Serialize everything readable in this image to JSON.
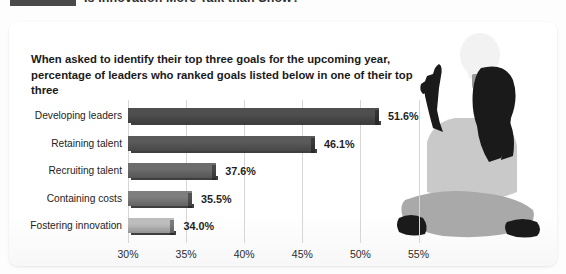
{
  "header": {
    "title": "Is Innovation More Talk than Show?",
    "rule_color": "#4a4a4a"
  },
  "card": {
    "subtitle": "When asked to identify their top three goals for the upcoming year, percentage of leaders who ranked goals listed below in one of their top three"
  },
  "illustration": {
    "person_name": "seated-person-silhouette",
    "bulb_name": "lightbulb-icon",
    "colors": {
      "dark": "#1a1a1a",
      "shirt": "#c9c9c9",
      "legs": "#a9a9a9",
      "bulb": "#f2f2f2",
      "bulb_base": "#9a9a9a"
    }
  },
  "chart_data": {
    "type": "bar",
    "orientation": "horizontal",
    "title": "Is Innovation More Talk than Show?",
    "subtitle": "When asked to identify their top three goals for the upcoming year, percentage of leaders who ranked goals listed below in one of their top three",
    "categories": [
      "Developing leaders",
      "Retaining talent",
      "Recruiting talent",
      "Containing costs",
      "Fostering innovation"
    ],
    "values": [
      51.6,
      46.1,
      37.6,
      35.5,
      34.0
    ],
    "value_labels": [
      "51.6%",
      "46.1%",
      "37.6%",
      "35.5%",
      "34.0%"
    ],
    "bar_colors": [
      "#4f4f4f",
      "#5a5a5a",
      "#6d6d6d",
      "#7e7e7e",
      "#bdbdbd"
    ],
    "xlabel": "",
    "ylabel": "",
    "xlim": [
      30,
      57
    ],
    "xticks": [
      30,
      35,
      40,
      45,
      50,
      55
    ],
    "xtick_labels": [
      "30%",
      "35%",
      "40%",
      "45%",
      "50%",
      "55%"
    ],
    "grid": true,
    "legend": false,
    "units": "percent"
  }
}
